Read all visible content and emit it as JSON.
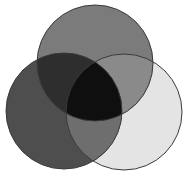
{
  "diagram": {
    "type": "venn",
    "set_count": 3,
    "labels_visible": false,
    "background": "#ffffff",
    "outline_color": "#3a3a3a",
    "sets": [
      {
        "id": "top",
        "cx": 95,
        "cy": 63,
        "r": 58,
        "fill": "#7b7b7b"
      },
      {
        "id": "left",
        "cx": 64,
        "cy": 111,
        "r": 58,
        "fill": "#4e4e4e"
      },
      {
        "id": "right",
        "cx": 124,
        "cy": 112,
        "r": 58,
        "fill": "#e4e4e4"
      }
    ],
    "intersections": {
      "top_right": "#8a8a8a",
      "left_right": "#6e6e6e",
      "top_left": "#2e2e2e",
      "all_three": "#0f0f0f"
    }
  }
}
